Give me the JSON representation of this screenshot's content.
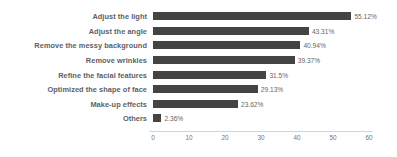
{
  "chart_data": {
    "type": "bar",
    "orientation": "horizontal",
    "title": "",
    "xlabel": "",
    "ylabel": "",
    "xlim": [
      0,
      60
    ],
    "xticks": [
      0,
      10,
      20,
      30,
      40,
      50,
      60
    ],
    "xtick_labels": [
      "0",
      "10",
      "20",
      "30",
      "40",
      "50",
      "60"
    ],
    "grid": false,
    "legend": false,
    "bar_color": "#3a3a3a",
    "label_color": "#55585c",
    "axis_color": "#d2d2d2",
    "categories": [
      "Adjust the light",
      "Adjust the angle",
      "Remove the messy background",
      "Remove wrinkles",
      "Refine the facial features",
      "Optimized the shape of face",
      "Make-up effects",
      "Others"
    ],
    "values": [
      55.12,
      43.31,
      40.94,
      39.37,
      31.5,
      29.13,
      23.62,
      2.36
    ],
    "value_labels": [
      "55.12%",
      "43.31%",
      "40.94%",
      "39.37%",
      "31.5%",
      "29.13%",
      "23.62%",
      "2.36%"
    ]
  }
}
